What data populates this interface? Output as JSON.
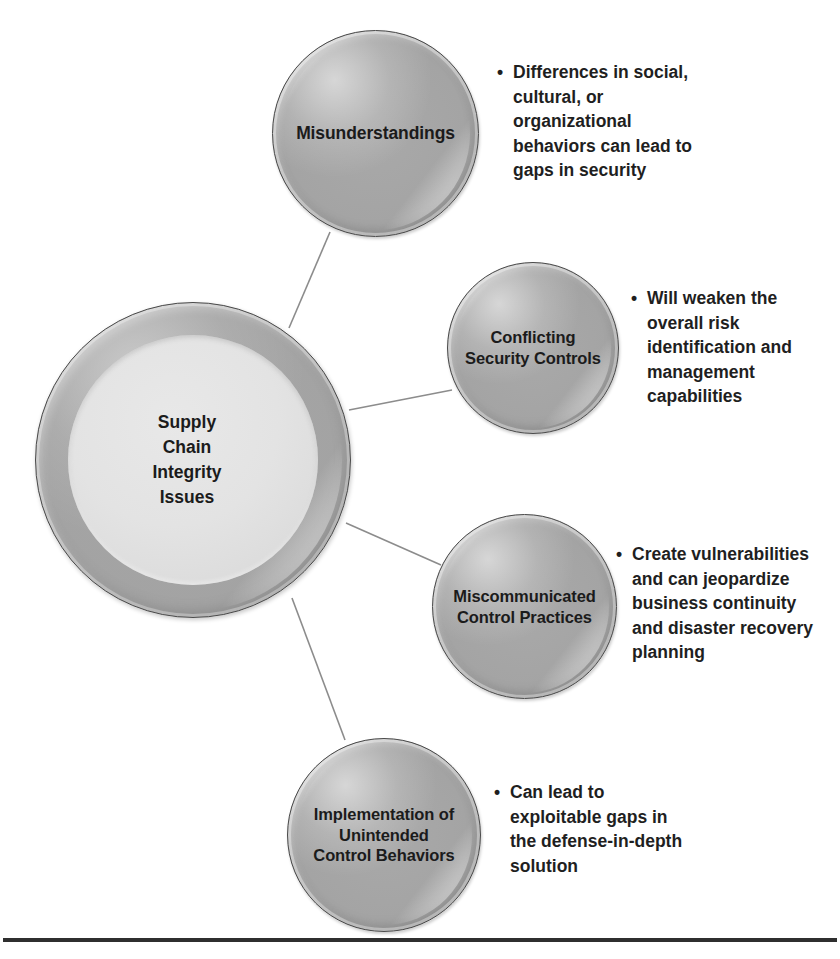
{
  "diagram": {
    "title": "Supply Chain Integrity Issues",
    "type": "radial-bubble-diagram",
    "center": {
      "label": "Supply\nChain\nIntegrity\nIssues",
      "lines": [
        "Supply",
        "Chain",
        "Integrity",
        "Issues"
      ]
    },
    "bullet_marker": "•",
    "colors": {
      "bubble_fill": "#a6a6a6",
      "bubble_outline": "#4a4a4a",
      "center_inner_fill": "#e3e3e3",
      "text": "#1b1b1b",
      "connector_line": "#8c8c8c",
      "bottom_rule": "#2f2f2f",
      "background": "#ffffff"
    },
    "nodes": [
      {
        "id": "misunderstandings",
        "label": "Misunderstandings",
        "lines": [
          "Misunderstandings"
        ],
        "bullets": [
          "Differences in social, cultural, or organizational behaviors can lead to gaps in security"
        ],
        "bullet_lines": [
          "Differences in social,",
          "cultural, or",
          "organizational",
          "behaviors can lead to",
          "gaps in security"
        ]
      },
      {
        "id": "conflicting-security-controls",
        "label": "Conflicting Security Controls",
        "lines": [
          "Conflicting",
          "Security Controls"
        ],
        "bullets": [
          "Will weaken the overall risk identification and management capabilities"
        ],
        "bullet_lines": [
          "Will weaken the",
          "overall risk",
          "identification and",
          "management",
          "capabilities"
        ]
      },
      {
        "id": "miscommunicated-control-practices",
        "label": "Miscommunicated Control Practices",
        "lines": [
          "Miscommunicated",
          "Control Practices"
        ],
        "bullets": [
          "Create vulnerabilities and can jeopardize business continuity and disaster recovery planning"
        ],
        "bullet_lines": [
          "Create vulnerabilities",
          "and can jeopardize",
          "business continuity",
          "and disaster recovery",
          "planning"
        ]
      },
      {
        "id": "implementation-of-unintended-control-behaviors",
        "label": "Implementation of Unintended Control Behaviors",
        "lines": [
          "Implementation of",
          "Unintended",
          "Control Behaviors"
        ],
        "bullets": [
          "Can lead to exploitable gaps in the defense-in-depth solution"
        ],
        "bullet_lines": [
          "Can lead to",
          "exploitable gaps in",
          "the defense-in-depth",
          "solution"
        ]
      }
    ]
  }
}
